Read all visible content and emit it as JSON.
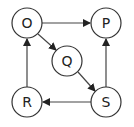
{
  "diagram": {
    "type": "directed-graph",
    "nodes": [
      {
        "id": "O",
        "label": "O",
        "x": 27,
        "y": 23
      },
      {
        "id": "P",
        "label": "P",
        "x": 106,
        "y": 23
      },
      {
        "id": "Q",
        "label": "Q",
        "x": 67,
        "y": 61
      },
      {
        "id": "R",
        "label": "R",
        "x": 27,
        "y": 102
      },
      {
        "id": "S",
        "label": "S",
        "x": 106,
        "y": 102
      }
    ],
    "edges": [
      {
        "from": "O",
        "to": "P"
      },
      {
        "from": "O",
        "to": "Q"
      },
      {
        "from": "Q",
        "to": "S"
      },
      {
        "from": "S",
        "to": "P"
      },
      {
        "from": "S",
        "to": "R"
      },
      {
        "from": "R",
        "to": "O"
      }
    ],
    "colors": {
      "stroke": "#333333",
      "fill": "#ffffff",
      "text": "#222222"
    }
  }
}
